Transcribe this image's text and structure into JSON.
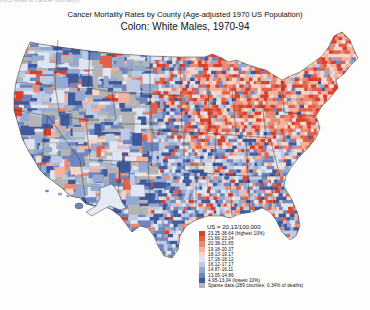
{
  "header": {
    "cut_text": "(NCI Atlas of cancer mortality)",
    "title": "Cancer Mortality Rates by County (Age-adjusted 1970 US Population)",
    "subtitle": "Colon:  White Males, 1970-94"
  },
  "legend": {
    "us_rate": "US = 20.13/100,000",
    "items": [
      {
        "label": "23.25-38.64 (highest 10%)",
        "color": "#d9402c"
      },
      {
        "label": "21.66-23.24",
        "color": "#e2604a"
      },
      {
        "label": "20.38-21.65",
        "color": "#ea8a72"
      },
      {
        "label": "19.18-20.37",
        "color": "#f2b29e"
      },
      {
        "label": "18.13-19.17",
        "color": "#f6d6c8"
      },
      {
        "label": "17.18-18.12",
        "color": "#dfe6f1"
      },
      {
        "label": "16.12-17.17",
        "color": "#bccbe3"
      },
      {
        "label": "14.87-16.11",
        "color": "#95a9d0"
      },
      {
        "label": "13.05-14.86",
        "color": "#6e86bb"
      },
      {
        "label": "4.95-13.04 (lowest 10%)",
        "color": "#3f5a9c"
      },
      {
        "label": "Sparse data (289 counties; 0.34% of deaths)",
        "color": "#b4b4b4"
      }
    ]
  },
  "map": {
    "region": "Contiguous United States, Alaska and Hawaii",
    "pattern": "Higher rates (red) concentrated in Northeast and Midwest; lower rates (blue) in West and South"
  }
}
